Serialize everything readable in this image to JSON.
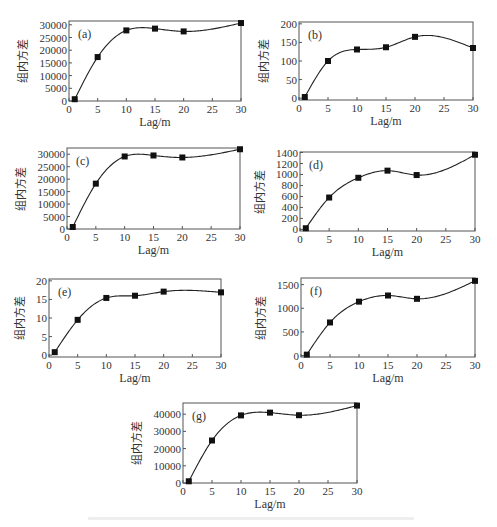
{
  "figure": {
    "y_label": "组内方差",
    "x_label": "Lag/m",
    "caption_visible_text": ""
  },
  "chart_data": [
    {
      "id": "a",
      "type": "line",
      "panel_label": "(a)",
      "title": "",
      "xlabel": "Lag/m",
      "ylabel": "组内方差",
      "x": [
        1,
        5,
        10,
        15,
        20,
        30
      ],
      "values": [
        700,
        17300,
        27800,
        28500,
        27400,
        30700
      ],
      "xlim": [
        0,
        30
      ],
      "ylim": [
        0,
        31500
      ],
      "xticks": [
        0,
        5,
        10,
        15,
        20,
        25,
        30
      ],
      "yticks": [
        0,
        5000,
        10000,
        15000,
        20000,
        25000,
        30000
      ],
      "grid": false,
      "legend": null,
      "box": {
        "left": 69,
        "top": 21,
        "right": 241,
        "bottom": 101
      }
    },
    {
      "id": "b",
      "type": "line",
      "panel_label": "(b)",
      "title": "",
      "xlabel": "Lag/m",
      "ylabel": "组内方差",
      "x": [
        1,
        5,
        10,
        15,
        20,
        30
      ],
      "values": [
        3,
        100,
        131,
        137,
        165,
        135
      ],
      "xlim": [
        0,
        30
      ],
      "ylim": [
        -5,
        205
      ],
      "xticks": [
        0,
        5,
        10,
        15,
        20,
        25,
        30
      ],
      "yticks": [
        0,
        50,
        100,
        150,
        200
      ],
      "grid": false,
      "legend": null,
      "box": {
        "left": 299,
        "top": 22,
        "right": 473,
        "bottom": 100
      }
    },
    {
      "id": "c",
      "type": "line",
      "panel_label": "(c)",
      "title": "",
      "xlabel": "Lag/m",
      "ylabel": "组内方差",
      "x": [
        1,
        5,
        10,
        15,
        20,
        30
      ],
      "values": [
        800,
        18200,
        29100,
        29500,
        28700,
        32000
      ],
      "xlim": [
        0,
        30
      ],
      "ylim": [
        0,
        32500
      ],
      "xticks": [
        0,
        5,
        10,
        15,
        20,
        25,
        30
      ],
      "yticks": [
        0,
        5000,
        10000,
        15000,
        20000,
        25000,
        30000
      ],
      "grid": false,
      "legend": null,
      "box": {
        "left": 67,
        "top": 148,
        "right": 240,
        "bottom": 229
      }
    },
    {
      "id": "d",
      "type": "line",
      "panel_label": "(d)",
      "title": "",
      "xlabel": "Lag/m",
      "ylabel": "组内方差",
      "x": [
        1,
        5,
        10,
        15,
        20,
        30
      ],
      "values": [
        20,
        580,
        940,
        1070,
        990,
        1360
      ],
      "xlim": [
        0,
        30
      ],
      "ylim": [
        -30,
        1410
      ],
      "xticks": [
        0,
        5,
        10,
        15,
        20,
        25,
        30
      ],
      "yticks": [
        0,
        200,
        400,
        600,
        800,
        1000,
        1200,
        1400
      ],
      "grid": false,
      "legend": null,
      "box": {
        "left": 300,
        "top": 152,
        "right": 475,
        "bottom": 231
      }
    },
    {
      "id": "e",
      "type": "line",
      "panel_label": "(e)",
      "title": "",
      "xlabel": "Lag/m",
      "ylabel": "组内方差",
      "x": [
        1,
        5,
        10,
        15,
        20,
        30
      ],
      "values": [
        0.8,
        9.5,
        15.4,
        16.0,
        17.1,
        16.9
      ],
      "xlim": [
        0,
        30
      ],
      "ylim": [
        -0.5,
        20.5
      ],
      "xticks": [
        0,
        5,
        10,
        15,
        20,
        25,
        30
      ],
      "yticks": [
        0,
        5,
        10,
        15,
        20
      ],
      "grid": false,
      "legend": null,
      "box": {
        "left": 49,
        "top": 279,
        "right": 221,
        "bottom": 357
      }
    },
    {
      "id": "f",
      "type": "line",
      "panel_label": "(f)",
      "title": "",
      "xlabel": "Lag/m",
      "ylabel": "组内方差",
      "x": [
        1,
        5,
        10,
        15,
        20,
        30
      ],
      "values": [
        20,
        700,
        1140,
        1270,
        1200,
        1580
      ],
      "xlim": [
        0,
        30
      ],
      "ylim": [
        -30,
        1640
      ],
      "xticks": [
        0,
        5,
        10,
        15,
        20,
        25,
        30
      ],
      "yticks": [
        0,
        500,
        1000,
        1500
      ],
      "grid": false,
      "legend": null,
      "box": {
        "left": 301,
        "top": 278,
        "right": 475,
        "bottom": 357
      }
    },
    {
      "id": "g",
      "type": "line",
      "panel_label": "(g)",
      "title": "",
      "xlabel": "Lag/m",
      "ylabel": "组内方差",
      "x": [
        1,
        5,
        10,
        15,
        20,
        30
      ],
      "values": [
        1000,
        24700,
        39300,
        40900,
        39400,
        45000
      ],
      "xlim": [
        0,
        30
      ],
      "ylim": [
        0,
        46500
      ],
      "xticks": [
        0,
        5,
        10,
        15,
        20,
        25,
        30
      ],
      "yticks": [
        0,
        10000,
        20000,
        30000,
        40000
      ],
      "grid": false,
      "legend": null,
      "box": {
        "left": 183,
        "top": 403,
        "right": 357,
        "bottom": 483
      }
    }
  ],
  "style": {
    "axis_color": "#555555",
    "line_color": "#222222",
    "marker_color": "#111111",
    "text_color": "#333333",
    "caption_color": "#eeeeee"
  }
}
